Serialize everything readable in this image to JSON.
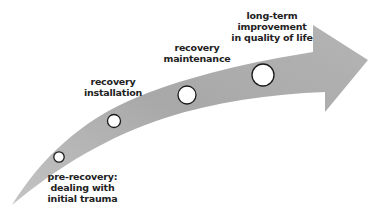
{
  "diagram": {
    "type": "curved-progress-arrow",
    "colors": {
      "arrow_fill": "#a9a9a9",
      "arrow_light": "#c8c8c8",
      "circle_fill": "#ffffff",
      "circle_stroke": "#1a1a1a",
      "text": "#222222"
    },
    "stages": [
      {
        "id": "pre-recovery",
        "lines": [
          "pre-recovery:",
          "dealing with",
          "initial trauma"
        ]
      },
      {
        "id": "recovery-installation",
        "lines": [
          "recovery",
          "installation"
        ]
      },
      {
        "id": "recovery-maintenance",
        "lines": [
          "recovery",
          "maintenance"
        ]
      },
      {
        "id": "long-term-improvement",
        "lines": [
          "long-term",
          "improvement",
          "in quality of life"
        ]
      }
    ]
  }
}
